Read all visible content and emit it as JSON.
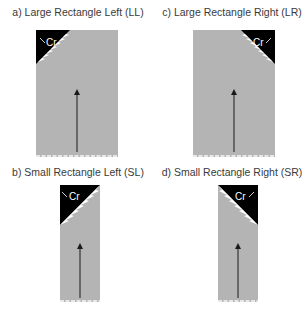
{
  "panels": [
    {
      "id": "LL",
      "title": "a) Large Rectangle Left (LL)",
      "label": "Cr",
      "side": "left",
      "size": "large"
    },
    {
      "id": "LR",
      "title": "c) Large Rectangle Right (LR)",
      "label": "Cr",
      "side": "right",
      "size": "large"
    },
    {
      "id": "SL",
      "title": "b) Small Rectangle Left (SL)",
      "label": "Cr",
      "side": "left",
      "size": "small"
    },
    {
      "id": "SR",
      "title": "d) Small Rectangle Right (SR)",
      "label": "Cr",
      "side": "right",
      "size": "small"
    }
  ],
  "colors": {
    "rect_fill": "#b4b4b4",
    "corner_fill": "#000000",
    "arrow": "#1a1a1a",
    "base_dots": "#e8e8e8",
    "title": "#3a3a3a"
  }
}
